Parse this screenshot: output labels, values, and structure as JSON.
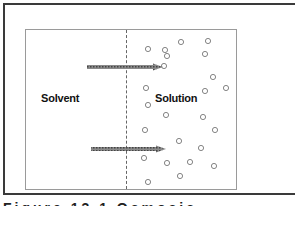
{
  "figure": {
    "labels": {
      "solvent": "Solvent",
      "solution": "Solution"
    },
    "caption": "Figure 13.1 Osmosis",
    "arrows": [
      {
        "x1": 87,
        "y1": 67,
        "x2": 163,
        "y2": 67
      },
      {
        "x1": 91,
        "y1": 149,
        "x2": 166,
        "y2": 149
      }
    ],
    "solute_particles": [
      [
        148,
        49
      ],
      [
        165,
        50
      ],
      [
        181,
        42
      ],
      [
        208,
        41
      ],
      [
        167,
        56
      ],
      [
        205,
        54
      ],
      [
        164,
        66
      ],
      [
        213,
        77
      ],
      [
        146,
        88
      ],
      [
        205,
        91
      ],
      [
        226,
        88
      ],
      [
        148,
        105
      ],
      [
        166,
        115
      ],
      [
        203,
        117
      ],
      [
        145,
        130
      ],
      [
        215,
        130
      ],
      [
        179,
        141
      ],
      [
        201,
        148
      ],
      [
        144,
        158
      ],
      [
        167,
        163
      ],
      [
        190,
        162
      ],
      [
        214,
        166
      ],
      [
        148,
        182
      ],
      [
        180,
        176
      ]
    ],
    "colors": {
      "frame": "#3a3a3a",
      "box": "#9a9a9a",
      "particle": "#777777",
      "arrow": "#555555"
    }
  }
}
